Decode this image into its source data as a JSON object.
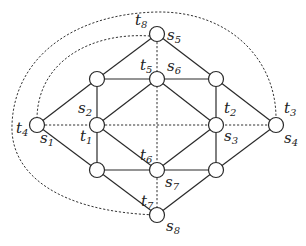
{
  "diagram": {
    "type": "graph",
    "nodes": [
      {
        "id": "n_top",
        "x": 157,
        "y": 34,
        "labels": [
          "s5",
          "t8"
        ]
      },
      {
        "id": "n_ul",
        "x": 97,
        "y": 79,
        "labels": []
      },
      {
        "id": "n_uc",
        "x": 157,
        "y": 79,
        "labels": [
          "t5",
          "s6"
        ]
      },
      {
        "id": "n_ur",
        "x": 216,
        "y": 79,
        "labels": []
      },
      {
        "id": "n_left",
        "x": 37,
        "y": 125,
        "labels": [
          "t4",
          "s1"
        ]
      },
      {
        "id": "n_ml",
        "x": 97,
        "y": 125,
        "labels": [
          "s2",
          "t1"
        ]
      },
      {
        "id": "n_mr",
        "x": 216,
        "y": 125,
        "labels": [
          "t2",
          "s3"
        ]
      },
      {
        "id": "n_right",
        "x": 276,
        "y": 125,
        "labels": [
          "t3",
          "s4"
        ]
      },
      {
        "id": "n_ll",
        "x": 97,
        "y": 170,
        "labels": []
      },
      {
        "id": "n_lc",
        "x": 157,
        "y": 170,
        "labels": [
          "t6",
          "s7"
        ]
      },
      {
        "id": "n_lr",
        "x": 216,
        "y": 170,
        "labels": []
      },
      {
        "id": "n_bot",
        "x": 157,
        "y": 215,
        "labels": [
          "t7",
          "s8"
        ]
      }
    ],
    "solid_edges": [
      [
        "n_top",
        "n_ul"
      ],
      [
        "n_top",
        "n_ur"
      ],
      [
        "n_ul",
        "n_uc"
      ],
      [
        "n_uc",
        "n_ur"
      ],
      [
        "n_ul",
        "n_ml"
      ],
      [
        "n_ur",
        "n_mr"
      ],
      [
        "n_ul",
        "n_left"
      ],
      [
        "n_ur",
        "n_right"
      ],
      [
        "n_uc",
        "n_ml"
      ],
      [
        "n_uc",
        "n_mr"
      ],
      [
        "n_ml",
        "n_lc"
      ],
      [
        "n_mr",
        "n_lc"
      ],
      [
        "n_ml",
        "n_ll"
      ],
      [
        "n_mr",
        "n_lr"
      ],
      [
        "n_left",
        "n_ll"
      ],
      [
        "n_right",
        "n_lr"
      ],
      [
        "n_ll",
        "n_lc"
      ],
      [
        "n_lc",
        "n_lr"
      ],
      [
        "n_ll",
        "n_bot"
      ],
      [
        "n_lr",
        "n_bot"
      ]
    ],
    "dashed_edges": [
      [
        "n_left",
        "n_ml"
      ],
      [
        "n_ml",
        "n_mr"
      ],
      [
        "n_mr",
        "n_right"
      ],
      [
        "n_top",
        "n_uc"
      ],
      [
        "n_uc",
        "n_lc"
      ],
      [
        "n_lc",
        "n_bot"
      ]
    ],
    "dashed_curves": [
      {
        "from": "n_bot",
        "to": "n_right",
        "via": "outer arc around left and top"
      },
      {
        "from": "n_top",
        "to": "n_left",
        "via": "inner arc upper-left"
      }
    ],
    "labels": {
      "s1": {
        "base": "s",
        "sub": "1"
      },
      "s2": {
        "base": "s",
        "sub": "2"
      },
      "s3": {
        "base": "s",
        "sub": "3"
      },
      "s4": {
        "base": "s",
        "sub": "4"
      },
      "s5": {
        "base": "s",
        "sub": "5"
      },
      "s6": {
        "base": "s",
        "sub": "6"
      },
      "s7": {
        "base": "s",
        "sub": "7"
      },
      "s8": {
        "base": "s",
        "sub": "8"
      },
      "t1": {
        "base": "t",
        "sub": "1"
      },
      "t2": {
        "base": "t",
        "sub": "2"
      },
      "t3": {
        "base": "t",
        "sub": "3"
      },
      "t4": {
        "base": "t",
        "sub": "4"
      },
      "t5": {
        "base": "t",
        "sub": "5"
      },
      "t6": {
        "base": "t",
        "sub": "6"
      },
      "t7": {
        "base": "t",
        "sub": "7"
      },
      "t8": {
        "base": "t",
        "sub": "8"
      }
    }
  }
}
